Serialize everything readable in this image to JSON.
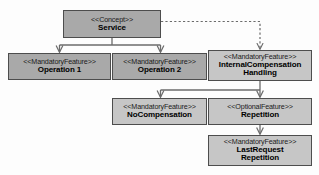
{
  "diagram": {
    "colors": {
      "node_fill_dark": "#a9a9a9",
      "node_fill_light": "#c6c6c6",
      "node_border": "#4d4d4d",
      "edge": "#6b6b6b",
      "background": "#fdfdfd"
    },
    "nodes": [
      {
        "id": "service",
        "stereotype": "<<Concept>>",
        "name_lines": [
          "Service"
        ],
        "name": "Service",
        "fill": "dark"
      },
      {
        "id": "operation_1",
        "stereotype": "<<MandatoryFeature>>",
        "name_lines": [
          "Operation 1"
        ],
        "name": "Operation 1",
        "fill": "dark"
      },
      {
        "id": "operation_2",
        "stereotype": "<<MandatoryFeature>>",
        "name_lines": [
          "Operation 2"
        ],
        "name": "Operation 2",
        "fill": "dark"
      },
      {
        "id": "internal_compensation_handling",
        "stereotype": "<<MandatoryFeature>>",
        "name_lines": [
          "InternalCompensation",
          "Handling"
        ],
        "name": "InternalCompensationHandling",
        "fill": "light"
      },
      {
        "id": "no_compensation",
        "stereotype": "<<MandatoryFeature>>",
        "name_lines": [
          "NoCompensation"
        ],
        "name": "NoCompensation",
        "fill": "light"
      },
      {
        "id": "repetition",
        "stereotype": "<<OptionalFeature>>",
        "name_lines": [
          "Repetition"
        ],
        "name": "Repetition",
        "fill": "light"
      },
      {
        "id": "last_request_repetition",
        "stereotype": "<<MandatoryFeature>>",
        "name_lines": [
          "LastRequest",
          "Repetition"
        ],
        "name": "LastRequestRepetition",
        "fill": "light"
      }
    ],
    "edges": [
      {
        "id": "service-to-operation-1",
        "from": "service",
        "to": "operation_1",
        "style": "solid",
        "arrow": "open"
      },
      {
        "id": "service-to-operation-2",
        "from": "service",
        "to": "operation_2",
        "style": "solid",
        "arrow": "open"
      },
      {
        "id": "service-to-internal-compensation-handling",
        "from": "service",
        "to": "internal_compensation_handling",
        "style": "dashed",
        "arrow": "open"
      },
      {
        "id": "ich-to-no-compensation",
        "from": "internal_compensation_handling",
        "to": "no_compensation",
        "style": "solid",
        "arrow": "open"
      },
      {
        "id": "ich-to-repetition",
        "from": "internal_compensation_handling",
        "to": "repetition",
        "style": "solid",
        "arrow": "open"
      },
      {
        "id": "repetition-to-last-request-repetition",
        "from": "repetition",
        "to": "last_request_repetition",
        "style": "solid",
        "arrow": "open"
      }
    ]
  }
}
